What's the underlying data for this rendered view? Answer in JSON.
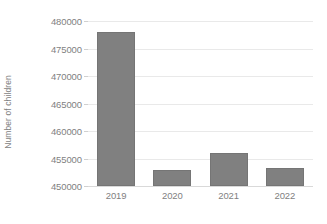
{
  "chart_data": {
    "type": "bar",
    "title": "",
    "subtitle": "",
    "xlabel": "",
    "ylabel": "Number of children",
    "categories": [
      "2019",
      "2020",
      "2021",
      "2022"
    ],
    "values": [
      478000,
      453000,
      456000,
      453200
    ],
    "series": [
      {
        "name": "Number of children",
        "values": [
          478000,
          453000,
          456000,
          453200
        ]
      }
    ],
    "ylim": [
      450000,
      480000
    ],
    "y_ticks": [
      450000,
      455000,
      460000,
      465000,
      470000,
      475000,
      480000
    ],
    "y_tick_labels": [
      "450000",
      "455000",
      "460000",
      "465000",
      "470000",
      "475000",
      "480000"
    ],
    "grid": true,
    "grid_axis": "y",
    "legend": false,
    "legend_position": "none",
    "annotations": [],
    "colors": {
      "bar_fill": "#808080",
      "bar_border": "#757575",
      "gridline": "#e9e9e9",
      "axis_line": "#d0d0d0",
      "text": "#7f7f7f",
      "background": "#ffffff"
    }
  }
}
